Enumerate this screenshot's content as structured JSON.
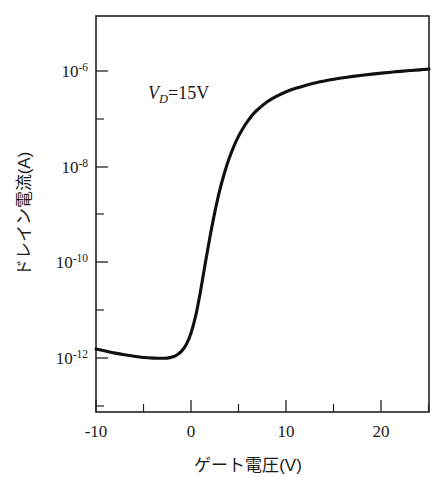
{
  "figure": {
    "name": "drain-current-vs-gate-voltage-transfer-curve",
    "background_color": "#ffffff",
    "line_color": "#101010",
    "axis_color": "#222222"
  },
  "annotations": [
    {
      "id": "vd-annotation",
      "symbol": "V",
      "subscript": "D",
      "relation": "=",
      "value": "15V",
      "full_text": "V_D = 15V",
      "x_volts": -5.0,
      "y_amps": 8e-07
    }
  ],
  "chart_data": {
    "type": "line",
    "title": "",
    "subtitle": "",
    "xlabel": "ゲート電圧(V)",
    "ylabel": "ドレイン電流(A)",
    "xlabel_parts": {
      "text": "ゲート電圧",
      "unit": "(V)"
    },
    "ylabel_parts": {
      "text": "ドレイン電流",
      "unit": "(A)"
    },
    "xscale": "linear",
    "yscale": "log",
    "xlim": [
      -10,
      25
    ],
    "ylim": [
      1e-13,
      3.2e-06
    ],
    "grid": false,
    "legend": null,
    "legend_position": "none",
    "x_ticks_major": [
      -10,
      0,
      10,
      20
    ],
    "x_tick_labels": [
      "-10",
      "0",
      "10",
      "20"
    ],
    "x_ticks_minor": [
      -5,
      5,
      15,
      25
    ],
    "y_ticks_major": [
      1e-06,
      1e-08,
      1e-10,
      1e-12
    ],
    "y_tick_labels": [
      "10-6",
      "10-8",
      "10-10",
      "10-12"
    ],
    "y_tick_mantissa": "10",
    "y_tick_exponents": [
      "-6",
      "-8",
      "-10",
      "-12"
    ],
    "y_ticks_minor": [
      1e-07,
      1e-09,
      1e-11,
      1e-13
    ],
    "series": [
      {
        "name": "drain current",
        "x": [
          -10.0,
          -9.0,
          -8.0,
          -7.0,
          -6.0,
          -5.0,
          -4.0,
          -3.0,
          -2.5,
          -2.0,
          -1.5,
          -1.0,
          -0.5,
          0.0,
          0.5,
          1.0,
          1.5,
          2.0,
          2.5,
          3.0,
          3.5,
          4.0,
          4.5,
          5.0,
          5.5,
          6.0,
          6.5,
          7.0,
          8.0,
          9.0,
          10.0,
          11.0,
          12.0,
          13.0,
          14.0,
          15.0,
          16.0,
          17.0,
          18.0,
          19.0,
          20.0,
          21.0,
          22.0,
          23.0,
          24.0,
          25.0
        ],
        "y": [
          1.55e-12,
          1.4e-12,
          1.27e-12,
          1.17e-12,
          1.09e-12,
          1.03e-12,
          1e-12,
          9.9e-13,
          1e-12,
          1.05e-12,
          1.16e-12,
          1.4e-12,
          1.95e-12,
          3.4e-12,
          8e-12,
          2.6e-11,
          1e-10,
          3.6e-10,
          1.15e-09,
          3.2e-09,
          7.4e-09,
          1.5e-08,
          2.7e-08,
          4.4e-08,
          6.6e-08,
          9.3e-08,
          1.24e-07,
          1.57e-07,
          2.28e-07,
          2.98e-07,
          3.68e-07,
          4.35e-07,
          5e-07,
          5.6e-07,
          6.17e-07,
          6.72e-07,
          7.23e-07,
          7.72e-07,
          8.18e-07,
          8.62e-07,
          9.04e-07,
          9.45e-07,
          9.84e-07,
          1.022e-06,
          1.058e-06,
          1.093e-06
        ]
      }
    ]
  }
}
